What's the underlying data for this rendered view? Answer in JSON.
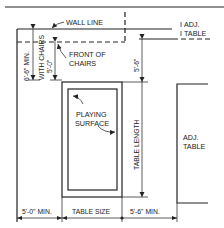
{
  "diagram": {
    "type": "floor-plan-clearance",
    "labels": {
      "wall_line": "WALL LINE",
      "front_of_chairs_line1": "FRONT OF",
      "front_of_chairs_line2": "CHAIRS",
      "adj_table_top_line1": "ADJ.",
      "adj_table_top_line2": "TABLE",
      "adj_table_right_line1": "ADJ.",
      "adj_table_right_line2": "TABLE",
      "playing_surface_line1": "PLAYING",
      "playing_surface_line2": "SURFACE",
      "table_length": "TABLE LENGTH",
      "with_chairs": "WITH CHAIRS"
    },
    "dimensions": {
      "left_min_with_chairs": "6'-6\" MIN.",
      "chairs_depth": "5'-0\"",
      "top_clearance": "5'-6\"",
      "bottom_left_min": "5'-0\" MIN.",
      "table_size": "TABLE SIZE",
      "bottom_right_min": "5'-6\" MIN."
    }
  }
}
